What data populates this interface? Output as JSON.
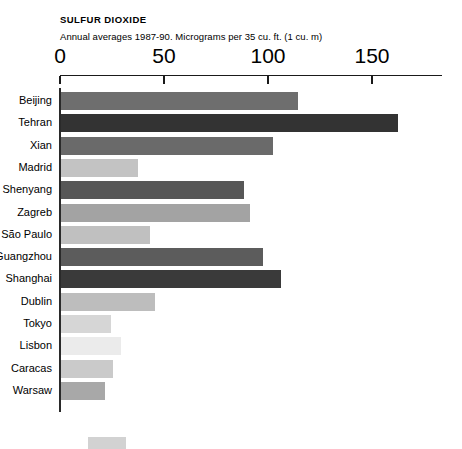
{
  "header": {
    "title": "SULFUR DIOXIDE",
    "subtitle": "Annual averages 1987-90. Micrograms per 35 cu. ft. (1 cu. m)"
  },
  "chart_data": {
    "type": "bar",
    "orientation": "horizontal",
    "title": "SULFUR DIOXIDE",
    "subtitle": "Annual averages 1987-90. Micrograms per 35 cu. ft. (1 cu. m)",
    "xlabel": "",
    "ylabel": "",
    "xlim": [
      0,
      150
    ],
    "axis_position": "top",
    "grid": false,
    "legend": "none",
    "tick_labels": [
      "0",
      "50",
      "100",
      "150"
    ],
    "ticks": [
      0,
      50,
      100,
      150
    ],
    "categories": [
      "Beijing",
      "Tehran",
      "Xian",
      "Madrid",
      "Shenyang",
      "Zagreb",
      "São Paulo",
      "Guangzhou",
      "Shanghai",
      "Dublin",
      "Tokyo",
      "Lisbon",
      "Caracas",
      "Warsaw"
    ],
    "values": [
      114,
      162,
      102,
      37,
      88,
      91,
      43,
      97,
      106,
      45,
      24,
      29,
      25,
      21
    ],
    "bar_colors": [
      "#6e6e6e",
      "#333333",
      "#6a6a6a",
      "#c3c3c3",
      "#575757",
      "#a3a3a3",
      "#c0c0c0",
      "#5c5c5c",
      "#3a3a3a",
      "#bdbdbd",
      "#d6d6d6",
      "#ebebeb",
      "#cacaca",
      "#a8a8a8"
    ]
  }
}
